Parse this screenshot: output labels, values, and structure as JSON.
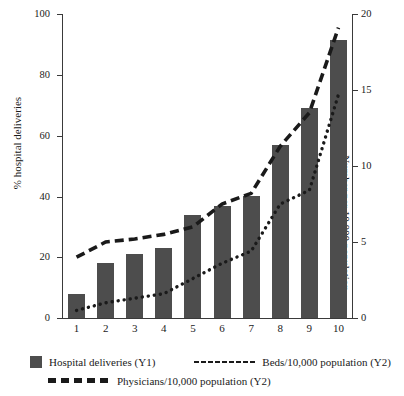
{
  "chart_data": {
    "type": "bar",
    "title": "",
    "subtitle": "",
    "xlabel": "",
    "categories": [
      "1",
      "2",
      "3",
      "4",
      "5",
      "6",
      "7",
      "8",
      "9",
      "10"
    ],
    "grid": false,
    "legend_position": "bottom",
    "y_axes": [
      {
        "id": "Y1",
        "side": "left",
        "label": "% hospital deliveries",
        "ylim": [
          0,
          100
        ],
        "ticks": [
          0,
          20,
          40,
          60,
          80,
          100
        ],
        "tick_labels": [
          "0",
          "20",
          "40",
          "60",
          "80",
          "100"
        ]
      },
      {
        "id": "Y2",
        "side": "right",
        "label": "Number per 10,000 population",
        "ylim": [
          0,
          20
        ],
        "ticks": [
          0,
          5,
          10,
          15,
          20
        ],
        "tick_labels": [
          "0",
          "5",
          "10",
          "15",
          "20"
        ]
      }
    ],
    "series": [
      {
        "name": "Hospital deliveries (Y1)",
        "type": "bar",
        "axis": "Y1",
        "color": "#4d4d4d",
        "values": [
          8,
          18,
          21,
          23,
          34,
          37,
          40,
          57,
          69,
          91.5
        ]
      },
      {
        "name": "Beds/10,000 population (Y2)",
        "type": "line",
        "style": "dotted",
        "axis": "Y2",
        "color": "#1a1a1a",
        "values": [
          0.5,
          1.0,
          1.3,
          1.6,
          2.6,
          3.6,
          4.4,
          7.5,
          8.4,
          14.7
        ]
      },
      {
        "name": "Physicians/10,000 population (Y2)",
        "type": "line",
        "style": "dashed",
        "axis": "Y2",
        "color": "#1a1a1a",
        "values": [
          4.0,
          5.0,
          5.2,
          5.5,
          6.0,
          7.5,
          8.2,
          11.3,
          13.5,
          19.1
        ]
      }
    ]
  },
  "axes": {
    "left": {
      "title": "% hospital deliveries",
      "labels": [
        "100",
        "80",
        "60",
        "40",
        "20",
        "0"
      ]
    },
    "right": {
      "title": "Number per 10,000 population",
      "labels": [
        "20",
        "15",
        "10",
        "5",
        "0"
      ]
    },
    "x": {
      "labels": [
        "1",
        "2",
        "3",
        "4",
        "5",
        "6",
        "7",
        "8",
        "9",
        "10"
      ]
    }
  },
  "legend": {
    "items": [
      {
        "marker": "bar-swatch-icon",
        "label": "Hospital deliveries (Y1)"
      },
      {
        "marker": "dotted-line-icon",
        "label": "Beds/10,000 population (Y2)"
      },
      {
        "marker": "dashed-line-icon",
        "label": "Physicians/10,000 population (Y2)"
      }
    ]
  },
  "colors": {
    "bar": "#4d4d4d",
    "line": "#1a1a1a",
    "axis": "#3a3a3a",
    "background": "#ffffff"
  }
}
